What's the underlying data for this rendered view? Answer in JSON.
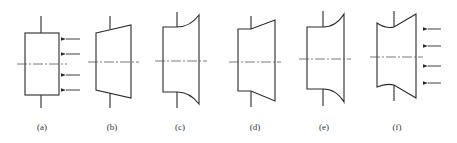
{
  "figure": {
    "panels": [
      {
        "id": "a",
        "label": "(a)",
        "shape": "rectangle",
        "arrows": true
      },
      {
        "id": "b",
        "label": "(b)",
        "shape": "tapered-straight",
        "arrows": false
      },
      {
        "id": "c",
        "label": "(c)",
        "shape": "stepped-concave-flare",
        "arrows": false
      },
      {
        "id": "d",
        "label": "(d)",
        "shape": "stepped-straight-flare",
        "arrows": false
      },
      {
        "id": "e",
        "label": "(e)",
        "shape": "stepped-concave-flare",
        "arrows": false
      },
      {
        "id": "f",
        "label": "(f)",
        "shape": "double-concave-flare",
        "arrows": true
      }
    ]
  }
}
